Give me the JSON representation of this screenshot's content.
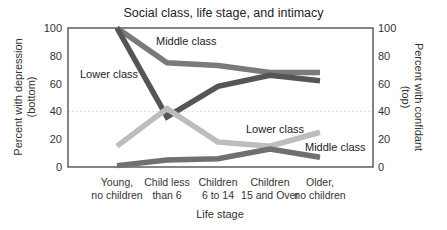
{
  "chart_data": {
    "type": "line",
    "title": "Social class, life stage, and intimacy",
    "xlabel": "Life stage",
    "ylabel_left": "Percent with depression (bottom)",
    "ylabel_right": "Percent with confidant (top)",
    "ylim": [
      0,
      100
    ],
    "yticks": [
      0,
      20,
      40,
      60,
      80,
      100
    ],
    "categories": [
      "Young, no children",
      "Child less than 6",
      "Children 6 to 14",
      "Children 15 and Over",
      "Older, no children"
    ],
    "category_lines": [
      [
        "Young,",
        "no children"
      ],
      [
        "Child less",
        "than 6"
      ],
      [
        "Children",
        "6 to 14"
      ],
      [
        "Children",
        "15 and Over"
      ],
      [
        "Older,",
        "no children"
      ]
    ],
    "series": [
      {
        "name": "Middle class (confidant)",
        "group": "top",
        "color": "#7a7a7a",
        "values": [
          100,
          75,
          73,
          68,
          68
        ]
      },
      {
        "name": "Lower class (confidant)",
        "group": "top",
        "color": "#555555",
        "values": [
          100,
          36,
          58,
          66,
          62
        ]
      },
      {
        "name": "Lower class (depression)",
        "group": "bottom",
        "color": "#bdbdbd",
        "values": [
          15,
          42,
          18,
          15,
          25
        ]
      },
      {
        "name": "Middle class (depression)",
        "group": "bottom",
        "color": "#707070",
        "values": [
          1,
          5,
          6,
          13,
          7
        ]
      }
    ],
    "annotations": [
      {
        "text": "Middle class",
        "x": 156,
        "y": 45
      },
      {
        "text": "Lower class",
        "x": 80,
        "y": 78
      },
      {
        "text": "Lower class",
        "x": 246,
        "y": 133
      },
      {
        "text": "Middle class",
        "x": 305,
        "y": 151
      }
    ],
    "grid": "horizontal dotted at 40",
    "legend": "inline labels"
  }
}
